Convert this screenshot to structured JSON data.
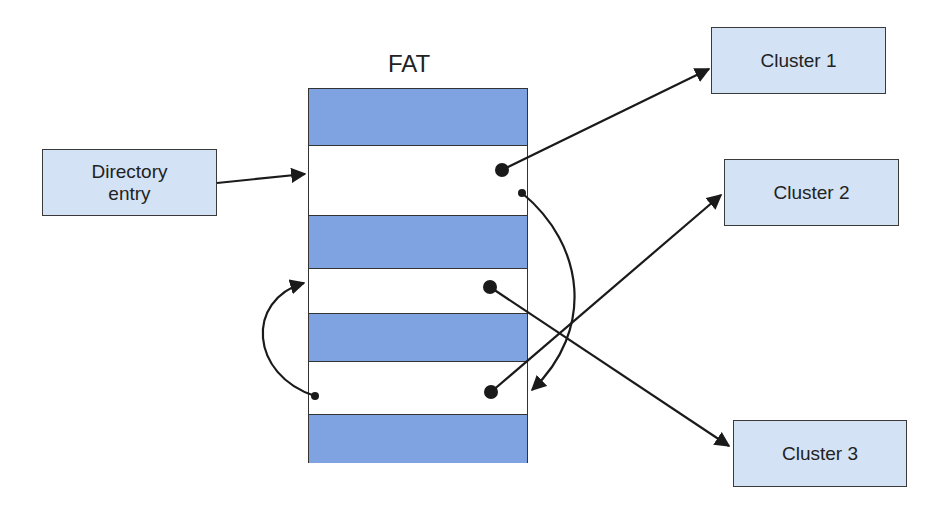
{
  "title": "FAT",
  "directory_entry": {
    "line1": "Directory",
    "line2": "entry"
  },
  "clusters": [
    {
      "label": "Cluster 1"
    },
    {
      "label": "Cluster 2"
    },
    {
      "label": "Cluster 3"
    }
  ],
  "fat_rows": [
    {
      "index": 0,
      "state": "filled"
    },
    {
      "index": 1,
      "state": "empty-pointer"
    },
    {
      "index": 2,
      "state": "filled"
    },
    {
      "index": 3,
      "state": "empty-pointer"
    },
    {
      "index": 4,
      "state": "filled"
    },
    {
      "index": 5,
      "state": "empty-pointer"
    },
    {
      "index": 6,
      "state": "filled"
    }
  ],
  "colors": {
    "box_fill": "#d3e3f5",
    "fat_filled": "#7fa3e0",
    "stroke": "#1a1a1a"
  }
}
